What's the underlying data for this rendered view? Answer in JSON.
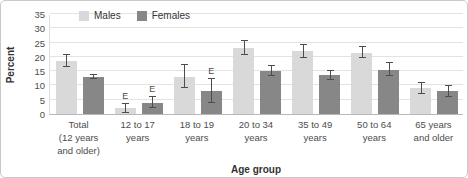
{
  "chart_data": {
    "type": "bar",
    "title": "",
    "xlabel": "Age group",
    "ylabel": "Percent",
    "ylim": [
      0,
      35
    ],
    "yticks": [
      0,
      5,
      10,
      15,
      20,
      25,
      30,
      35
    ],
    "grid": "horizontal",
    "legend_position": "top-left-inside",
    "error_bars": true,
    "flag_symbol": "E",
    "categories": [
      "Total\n(12 years\nand older)",
      "12 to 17\nyears",
      "18 to 19\nyears",
      "20 to 34\nyears",
      "35 to 49\nyears",
      "50 to 64\nyears",
      "65 years\nand older"
    ],
    "series": [
      {
        "name": "Males",
        "color": "#d9d9d9",
        "values": [
          18.5,
          2,
          13,
          23,
          22,
          21.5,
          9
        ],
        "errors": [
          2,
          1.5,
          4,
          2.5,
          2.3,
          2,
          2
        ],
        "flags": [
          "",
          "E",
          "",
          "",
          "",
          "",
          ""
        ]
      },
      {
        "name": "Females",
        "color": "#878787",
        "values": [
          13,
          4,
          8,
          15,
          13.5,
          15.5,
          8
        ],
        "errors": [
          0.8,
          2,
          4.3,
          1.8,
          1.6,
          2.3,
          1.9
        ],
        "flags": [
          "",
          "E",
          "E",
          "",
          "",
          "",
          ""
        ]
      }
    ],
    "colors": {
      "males_bar": "#d9d9d9",
      "females_bar": "#878787",
      "grid": "#e3e3e3",
      "axis": "#b8b8b8",
      "error_bar": "#4d4d4d",
      "tick_text": "#4d4d4d",
      "axis_title_text": "#333333",
      "figure_border": "#c9c9c9",
      "background": "#ffffff"
    }
  }
}
